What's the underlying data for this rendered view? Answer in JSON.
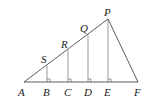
{
  "diagram": {
    "type": "geometry",
    "points": {
      "A": {
        "label": "A",
        "x": 24,
        "y": 82
      },
      "B": {
        "label": "B",
        "x": 47,
        "y": 82
      },
      "C": {
        "label": "C",
        "x": 68,
        "y": 82
      },
      "D": {
        "label": "D",
        "x": 88,
        "y": 82
      },
      "E": {
        "label": "E",
        "x": 108,
        "y": 82
      },
      "F": {
        "label": "F",
        "x": 138,
        "y": 82
      },
      "S": {
        "label": "S",
        "x": 47,
        "y": 66
      },
      "R": {
        "label": "R",
        "x": 68,
        "y": 51
      },
      "Q": {
        "label": "Q",
        "x": 88,
        "y": 36
      },
      "P": {
        "label": "P",
        "x": 108,
        "y": 19
      }
    },
    "segments": [
      [
        "A",
        "F"
      ],
      [
        "A",
        "P"
      ],
      [
        "P",
        "F"
      ],
      [
        "S",
        "B"
      ],
      [
        "R",
        "C"
      ],
      [
        "Q",
        "D"
      ],
      [
        "P",
        "E"
      ]
    ],
    "right_angles": [
      "B",
      "C",
      "D",
      "E"
    ],
    "colors": {
      "stroke": "#333333",
      "label": "#222222",
      "background": "#ffffff"
    }
  }
}
